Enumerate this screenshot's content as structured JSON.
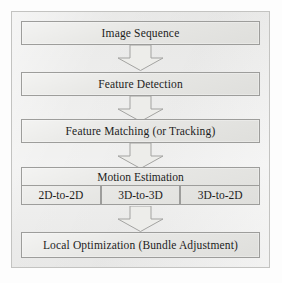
{
  "diagram": {
    "type": "vertical-flowchart",
    "colors": {
      "page_background": "#fdfdfd",
      "frame_background": "#ececeb",
      "frame_border": "#c3c3c1",
      "node_fill": "#e4e4e1",
      "node_border": "#9d9d9b",
      "arrow_fill": "#ededea",
      "arrow_border": "#a3a3a1",
      "text": "#1d1d1d"
    },
    "nodes": [
      {
        "id": "image-sequence",
        "label": "Image Sequence"
      },
      {
        "id": "feature-detection",
        "label": "Feature Detection"
      },
      {
        "id": "feature-matching",
        "label": "Feature Matching (or Tracking)"
      },
      {
        "id": "motion-estimation",
        "label": "Motion Estimation"
      },
      {
        "id": "local-optimization",
        "label": "Local Optimization (Bundle Adjustment)"
      }
    ],
    "motion_estimation_methods": [
      {
        "id": "2d-to-2d",
        "label": "2D-to-2D"
      },
      {
        "id": "3d-to-3d",
        "label": "3D-to-3D"
      },
      {
        "id": "3d-to-2d",
        "label": "3D-to-2D"
      }
    ],
    "connectors": [
      {
        "id": "arrow-1",
        "icon": "down-block-arrow-icon",
        "from": "image-sequence",
        "to": "feature-detection"
      },
      {
        "id": "arrow-2",
        "icon": "down-block-arrow-icon",
        "from": "feature-detection",
        "to": "feature-matching"
      },
      {
        "id": "arrow-3",
        "icon": "down-block-arrow-icon",
        "from": "feature-matching",
        "to": "motion-estimation"
      },
      {
        "id": "arrow-4",
        "icon": "down-block-arrow-icon",
        "from": "motion-estimation",
        "to": "local-optimization"
      }
    ]
  }
}
